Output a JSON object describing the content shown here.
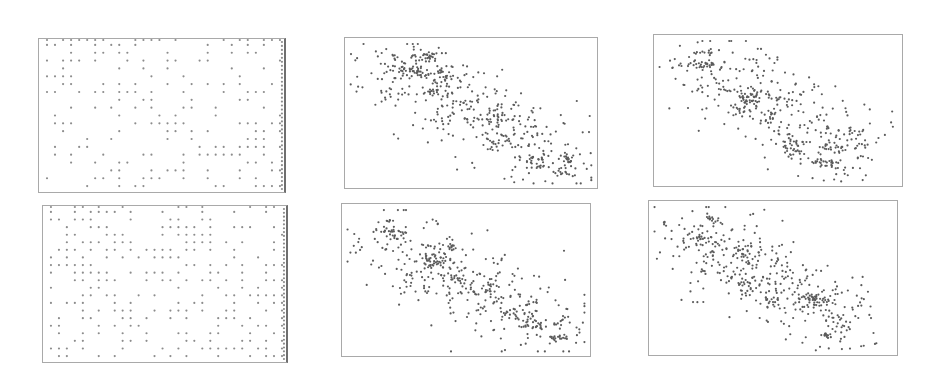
{
  "chart_data": [
    {
      "id": "grid-top",
      "type": "scatter",
      "title": "",
      "xlabel": "",
      "ylabel": "",
      "grid": false,
      "legend": null,
      "description": "Points snapped to a regular lattice (sparse, roughly uniform), denser toward lower-right; right edge column heavily filled",
      "box": {
        "x": 38,
        "y": 38,
        "w": 248,
        "h": 155
      },
      "lattice": {
        "cols": 30,
        "rows": 19,
        "density": 0.36,
        "edge_right": true,
        "edge_top": true,
        "bias": "lower-right",
        "seed": 11
      },
      "point_color": "#8c8c8c",
      "point_r": 1.1
    },
    {
      "id": "cluster-top-mid",
      "type": "scatter",
      "title": "",
      "xlabel": "",
      "ylabel": "",
      "grid": false,
      "legend": null,
      "description": "Negatively correlated point cloud from upper-left to lower-right with dense clumps",
      "box": {
        "x": 344,
        "y": 37,
        "w": 254,
        "h": 152
      },
      "background_points": {
        "count": 330,
        "x0": 0.14,
        "y0": 0.18,
        "x1": 0.88,
        "y1": 0.82,
        "spread": 0.13,
        "seed": 21
      },
      "clusters": [
        {
          "cx": 0.32,
          "cy": 0.12,
          "sx": 0.025,
          "sy": 0.02,
          "n": 28
        },
        {
          "cx": 0.27,
          "cy": 0.22,
          "sx": 0.03,
          "sy": 0.03,
          "n": 34
        },
        {
          "cx": 0.38,
          "cy": 0.25,
          "sx": 0.035,
          "sy": 0.04,
          "n": 30
        },
        {
          "cx": 0.37,
          "cy": 0.36,
          "sx": 0.03,
          "sy": 0.02,
          "n": 16
        },
        {
          "cx": 0.61,
          "cy": 0.55,
          "sx": 0.03,
          "sy": 0.03,
          "n": 22
        },
        {
          "cx": 0.6,
          "cy": 0.67,
          "sx": 0.025,
          "sy": 0.025,
          "n": 14
        },
        {
          "cx": 0.76,
          "cy": 0.82,
          "sx": 0.03,
          "sy": 0.03,
          "n": 26
        },
        {
          "cx": 0.89,
          "cy": 0.81,
          "sx": 0.015,
          "sy": 0.025,
          "n": 16
        },
        {
          "cx": 0.87,
          "cy": 0.9,
          "sx": 0.02,
          "sy": 0.012,
          "n": 12
        },
        {
          "cx": 0.19,
          "cy": 0.12,
          "sx": 0.006,
          "sy": 0.015,
          "n": 5
        }
      ],
      "point_color": "#5b5b5b",
      "point_r": 1.1
    },
    {
      "id": "cluster-top-right",
      "type": "scatter",
      "title": "",
      "xlabel": "",
      "ylabel": "",
      "grid": false,
      "legend": null,
      "description": "Negatively correlated point cloud; dense clumps at upper-left, center and lower-right",
      "box": {
        "x": 653,
        "y": 34,
        "w": 250,
        "h": 153
      },
      "background_points": {
        "count": 300,
        "x0": 0.18,
        "y0": 0.22,
        "x1": 0.82,
        "y1": 0.75,
        "spread": 0.13,
        "seed": 31
      },
      "clusters": [
        {
          "cx": 0.2,
          "cy": 0.2,
          "sx": 0.025,
          "sy": 0.02,
          "n": 26
        },
        {
          "cx": 0.4,
          "cy": 0.4,
          "sx": 0.035,
          "sy": 0.025,
          "n": 32
        },
        {
          "cx": 0.36,
          "cy": 0.47,
          "sx": 0.025,
          "sy": 0.03,
          "n": 14
        },
        {
          "cx": 0.57,
          "cy": 0.71,
          "sx": 0.03,
          "sy": 0.03,
          "n": 24
        },
        {
          "cx": 0.56,
          "cy": 0.78,
          "sx": 0.02,
          "sy": 0.02,
          "n": 12
        },
        {
          "cx": 0.69,
          "cy": 0.85,
          "sx": 0.025,
          "sy": 0.015,
          "n": 26
        },
        {
          "cx": 0.73,
          "cy": 0.75,
          "sx": 0.03,
          "sy": 0.015,
          "n": 20
        },
        {
          "cx": 0.83,
          "cy": 0.72,
          "sx": 0.015,
          "sy": 0.05,
          "n": 14
        },
        {
          "cx": 0.21,
          "cy": 0.11,
          "sx": 0.03,
          "sy": 0.015,
          "n": 12
        }
      ],
      "point_color": "#5b5b5b",
      "point_r": 1.1
    },
    {
      "id": "grid-bottom",
      "type": "scatter",
      "title": "",
      "xlabel": "",
      "ylabel": "",
      "grid": false,
      "legend": null,
      "description": "Points snapped to a regular lattice (sparse, roughly uniform), denser toward left and lower-right; right edge column heavily filled",
      "box": {
        "x": 42,
        "y": 205,
        "w": 246,
        "h": 158
      },
      "lattice": {
        "cols": 30,
        "rows": 20,
        "density": 0.4,
        "edge_right": true,
        "edge_top": true,
        "bias": "left-and-lower-right",
        "seed": 41
      },
      "point_color": "#8c8c8c",
      "point_r": 1.1
    },
    {
      "id": "cluster-bottom-mid",
      "type": "scatter",
      "title": "",
      "xlabel": "",
      "ylabel": "",
      "grid": false,
      "legend": null,
      "description": "Negatively correlated point cloud from upper-left to lower-right with dense clumps",
      "box": {
        "x": 341,
        "y": 203,
        "w": 250,
        "h": 154
      },
      "background_points": {
        "count": 330,
        "x0": 0.14,
        "y0": 0.22,
        "x1": 0.88,
        "y1": 0.8,
        "spread": 0.13,
        "seed": 51
      },
      "clusters": [
        {
          "cx": 0.2,
          "cy": 0.18,
          "sx": 0.03,
          "sy": 0.02,
          "n": 24
        },
        {
          "cx": 0.19,
          "cy": 0.11,
          "sx": 0.01,
          "sy": 0.005,
          "n": 6
        },
        {
          "cx": 0.38,
          "cy": 0.37,
          "sx": 0.03,
          "sy": 0.025,
          "n": 30
        },
        {
          "cx": 0.43,
          "cy": 0.28,
          "sx": 0.02,
          "sy": 0.015,
          "n": 12
        },
        {
          "cx": 0.46,
          "cy": 0.49,
          "sx": 0.03,
          "sy": 0.02,
          "n": 18
        },
        {
          "cx": 0.58,
          "cy": 0.57,
          "sx": 0.02,
          "sy": 0.02,
          "n": 12
        },
        {
          "cx": 0.73,
          "cy": 0.75,
          "sx": 0.03,
          "sy": 0.025,
          "n": 14
        },
        {
          "cx": 0.77,
          "cy": 0.8,
          "sx": 0.02,
          "sy": 0.02,
          "n": 14
        },
        {
          "cx": 0.88,
          "cy": 0.88,
          "sx": 0.02,
          "sy": 0.01,
          "n": 18
        },
        {
          "cx": 0.9,
          "cy": 0.78,
          "sx": 0.015,
          "sy": 0.02,
          "n": 10
        }
      ],
      "point_color": "#5b5b5b",
      "point_r": 1.1
    },
    {
      "id": "cluster-bottom-right",
      "type": "scatter",
      "title": "",
      "xlabel": "",
      "ylabel": "",
      "grid": false,
      "legend": null,
      "description": "Negatively correlated point cloud; dense clumps upper-left, center and lower-right",
      "box": {
        "x": 648,
        "y": 200,
        "w": 250,
        "h": 156
      },
      "background_points": {
        "count": 330,
        "x0": 0.18,
        "y0": 0.22,
        "x1": 0.8,
        "y1": 0.78,
        "spread": 0.13,
        "seed": 61
      },
      "clusters": [
        {
          "cx": 0.2,
          "cy": 0.25,
          "sx": 0.035,
          "sy": 0.035,
          "n": 30
        },
        {
          "cx": 0.25,
          "cy": 0.12,
          "sx": 0.02,
          "sy": 0.01,
          "n": 14
        },
        {
          "cx": 0.06,
          "cy": 0.14,
          "sx": 0.005,
          "sy": 0.015,
          "n": 5
        },
        {
          "cx": 0.38,
          "cy": 0.33,
          "sx": 0.03,
          "sy": 0.03,
          "n": 18
        },
        {
          "cx": 0.4,
          "cy": 0.53,
          "sx": 0.025,
          "sy": 0.04,
          "n": 20
        },
        {
          "cx": 0.5,
          "cy": 0.64,
          "sx": 0.025,
          "sy": 0.03,
          "n": 14
        },
        {
          "cx": 0.67,
          "cy": 0.63,
          "sx": 0.03,
          "sy": 0.02,
          "n": 32
        },
        {
          "cx": 0.77,
          "cy": 0.78,
          "sx": 0.025,
          "sy": 0.03,
          "n": 16
        },
        {
          "cx": 0.72,
          "cy": 0.87,
          "sx": 0.015,
          "sy": 0.01,
          "n": 14
        }
      ],
      "point_color": "#5b5b5b",
      "point_r": 1.1
    }
  ]
}
